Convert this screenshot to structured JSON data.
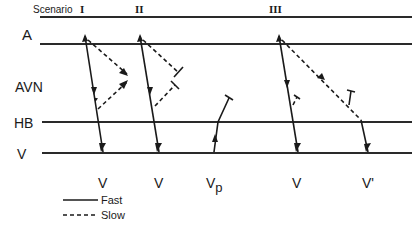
{
  "header": {
    "scenario_label": "Scenario",
    "scenarios": [
      "I",
      "II",
      "III"
    ]
  },
  "levels": {
    "atrium": "A",
    "av_node": "AVN",
    "his_bundle": "HB",
    "ventricle": "V"
  },
  "bottom_labels": {
    "s1": "V",
    "s2": "V",
    "vp_main": "V",
    "vp_sub": "p",
    "s3": "V",
    "s3_prime": "V'"
  },
  "legend": {
    "fast": "Fast",
    "slow": "Slow"
  },
  "colors": {
    "ink": "#1a1a1a",
    "background": "#ffffff"
  }
}
